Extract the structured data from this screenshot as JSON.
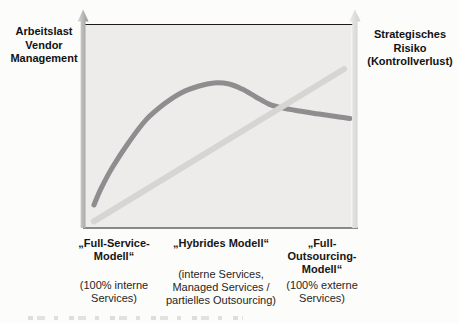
{
  "figure": {
    "left_axis_label": "Arbeitslast\nVendor\nManagement",
    "right_axis_label": "Strategisches\nRisiko\n(Kontrollverlust)",
    "columns": [
      {
        "title": "„Full-Service-\nModell“",
        "subtitle": "(100% interne\nServices)"
      },
      {
        "title": "„Hybrides Modell“",
        "subtitle": "(interne Services,\nManaged Services /\npartielles Outsourcing)"
      },
      {
        "title": "„Full-\nOutsourcing-\nModell“",
        "subtitle": "(100% externe\nServices)"
      }
    ]
  },
  "colors": {
    "plot_bg": "#edecea",
    "frame_line": "#1b1b1b",
    "workload_curve": "#8e8e90",
    "risk_line": "#d5d6d2",
    "arrow_left_light": "#d9d9d9",
    "arrow_left_dark": "#969696",
    "arrow_right_light": "#ececec",
    "arrow_right_dark": "#cfcfcf"
  },
  "chart_data": {
    "type": "line",
    "title": "",
    "xlabel": "",
    "left_axis": "Arbeitslast Vendor Management",
    "right_axis": "Strategisches Risiko (Kontrollverlust)",
    "x_categories": [
      "„Full-Service-Modell“ (100% interne Services)",
      "„Hybrides Modell“ (interne Services, Managed Services / partielles Outsourcing)",
      "„Full-Outsourcing-Modell“ (100% externe Services)"
    ],
    "axes_qualitative": true,
    "grid": false,
    "legend": "none",
    "xlim": [
      0,
      100
    ],
    "ylim": [
      0,
      100
    ],
    "layout": {
      "plot": {
        "x0": 86,
        "y0": 24.5,
        "x1": 351.5,
        "y1": 227.5
      }
    },
    "series": [
      {
        "name": "Arbeitslast Vendor Management",
        "shape": "rises steeply, peaks at hybrid model, then declines moderately",
        "color": "#8e8e90",
        "stroke_width": 5,
        "smooth": true,
        "points": [
          [
            3.0,
            11.1
          ],
          [
            5.6,
            19.0
          ],
          [
            9.8,
            29.3
          ],
          [
            16.2,
            42.1
          ],
          [
            22.6,
            53.0
          ],
          [
            29.4,
            60.8
          ],
          [
            35.8,
            66.3
          ],
          [
            42.6,
            69.7
          ],
          [
            48.2,
            71.2
          ],
          [
            53.9,
            70.7
          ],
          [
            58.8,
            68.2
          ],
          [
            64.0,
            64.3
          ],
          [
            68.9,
            60.8
          ],
          [
            73.8,
            58.9
          ],
          [
            80.2,
            57.4
          ],
          [
            87.8,
            55.9
          ],
          [
            95.3,
            54.4
          ],
          [
            99.4,
            53.7
          ]
        ]
      },
      {
        "name": "Strategisches Risiko (Kontrollverlust)",
        "shape": "linear increase from bottom-left to top-right",
        "color": "#d5d6d2",
        "stroke_width": 6,
        "smooth": false,
        "points": [
          [
            3.0,
            3.0
          ],
          [
            97.2,
            78.1
          ]
        ]
      }
    ]
  }
}
